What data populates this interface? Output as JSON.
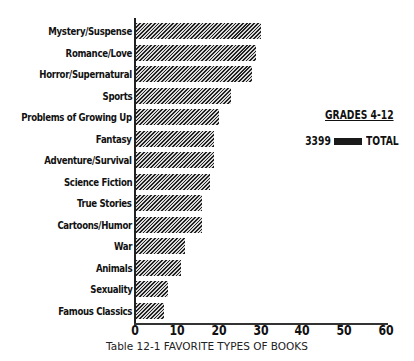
{
  "chart_data": {
    "type": "bar",
    "orientation": "horizontal",
    "title": "Table 12-1 FAVORITE TYPES OF BOOKS",
    "xlabel": "",
    "ylabel": "",
    "xlim": [
      0,
      60
    ],
    "x_ticks": [
      "0",
      "10",
      "20",
      "30",
      "40",
      "50",
      "60"
    ],
    "grid": false,
    "legend_position": "right",
    "categories": [
      "Mystery/Suspense",
      "Romance/Love",
      "Horror/Supernatural",
      "Sports",
      "Problems of Growing Up",
      "Fantasy",
      "Adventure/Survival",
      "Science Fiction",
      "True Stories",
      "Cartoons/Humor",
      "War",
      "Animals",
      "Sexuality",
      "Famous Classics"
    ],
    "series": [
      {
        "name": "TOTAL",
        "count": "3399",
        "values": [
          30,
          29,
          28,
          23,
          20,
          19,
          19,
          18,
          16,
          16,
          12,
          11,
          8,
          7
        ]
      }
    ]
  },
  "legend": {
    "title": "GRADES 4-12",
    "count": "3399",
    "label": "TOTAL"
  },
  "caption": "Table 12-1 FAVORITE TYPES OF BOOKS",
  "style": {
    "bar_color": "#222222",
    "axis_color": "#222222"
  }
}
